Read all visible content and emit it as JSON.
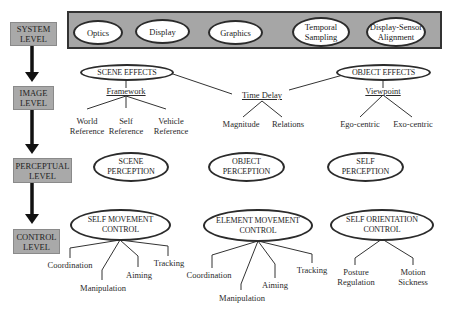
{
  "levels": [
    {
      "label_line1": "SYSTEM",
      "label_line2": "LEVEL"
    },
    {
      "label_line1": "IMAGE",
      "label_line2": "LEVEL"
    },
    {
      "label_line1": "PERCEPTUAL",
      "label_line2": "LEVEL"
    },
    {
      "label_line1": "CONTROL",
      "label_line2": "LEVEL"
    }
  ],
  "system": {
    "items": [
      "Optics",
      "Display",
      "Graphics",
      "Temporal Sampling",
      "Display-Sensor Alignment"
    ],
    "temporal_line1": "Temporal",
    "temporal_line2": "Sampling",
    "alignment_line1": "Display-Sensor",
    "alignment_line2": "Alignment"
  },
  "image": {
    "scene_effects": "SCENE EFFECTS",
    "object_effects": "OBJECT EFFECTS",
    "framework": {
      "label": "Framework",
      "children": [
        {
          "line1": "World",
          "line2": "Reference"
        },
        {
          "line1": "Self",
          "line2": "Reference"
        },
        {
          "line1": "Vehicle",
          "line2": "Reference"
        }
      ]
    },
    "time_delay": {
      "label": "Time Delay",
      "children": [
        "Magnitude",
        "Relations"
      ]
    },
    "viewpoint": {
      "label": "Viewpoint",
      "children": [
        "Ego-centric",
        "Exo-centric"
      ]
    }
  },
  "perceptual": {
    "nodes": [
      {
        "line1": "SCENE",
        "line2": "PERCEPTION"
      },
      {
        "line1": "OBJECT",
        "line2": "PERCEPTION"
      },
      {
        "line1": "SELF",
        "line2": "PERCEPTION"
      }
    ]
  },
  "control": {
    "self_movement": {
      "line1": "SELF MOVEMENT",
      "line2": "CONTROL",
      "children": [
        "Coordination",
        "Manipulation",
        "Aiming",
        "Tracking"
      ]
    },
    "element_movement": {
      "line1": "ELEMENT MOVEMENT",
      "line2": "CONTROL",
      "children": [
        "Coordination",
        "Manipulation",
        "Aiming",
        "Tracking"
      ]
    },
    "self_orientation": {
      "line1": "SELF ORIENTATION",
      "line2": "CONTROL",
      "children": [
        {
          "line1": "Posture",
          "line2": "Regulation"
        },
        {
          "line1": "Motion",
          "line2": "Sickness"
        }
      ]
    }
  },
  "colors": {
    "level_box": "#a9a9a9",
    "system_bar": "#a6a6a6",
    "stroke": "#2b2b2b"
  }
}
